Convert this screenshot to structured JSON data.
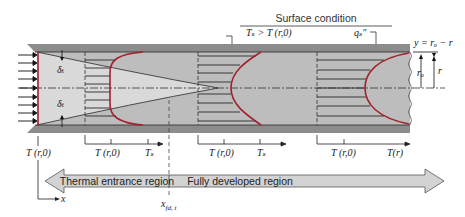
{
  "header": {
    "surface_condition_label": "Surface condition",
    "condition_temp": "Tₛ > T (r,0)",
    "condition_flux": "qₛ″"
  },
  "geometry": {
    "y_definition": "y = rₒ − r",
    "ro_label": "rₒ",
    "r_label": "r",
    "delta_t_top": "δₜ",
    "delta_t_bottom": "δₜ"
  },
  "profiles": [
    {
      "name": "inlet",
      "axis_labels": [
        "T (r,0)"
      ]
    },
    {
      "name": "entrance",
      "axis_labels": [
        "T (r,0)",
        "Tₛ"
      ]
    },
    {
      "name": "developed-constant-Ts",
      "axis_labels": [
        "T (r,0)",
        "Tₛ"
      ]
    },
    {
      "name": "developed-constant-flux",
      "axis_labels": [
        "T (r,0)",
        "T(r)"
      ]
    }
  ],
  "regions": {
    "entrance_label": "Thermal entrance region",
    "developed_label": "Fully developed region",
    "boundary_label": "xₒₒ,ₜ",
    "boundary_text": "x",
    "boundary_sub": "fd, t",
    "x_axis_label": "x"
  },
  "colors": {
    "wall": "#8c8c8c",
    "fluid": "#bdbdbd",
    "core": "#d9d9d9",
    "profile": "#a3202f",
    "line": "#2a2a2a",
    "arrow_fill": "#d3d3d3"
  }
}
